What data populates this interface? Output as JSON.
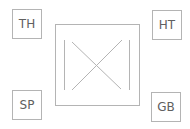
{
  "diagram": {
    "corner_labels": {
      "top_left": "TH",
      "top_right": "HT",
      "bottom_left": "SP",
      "bottom_right": "GB"
    },
    "center_symbol": "square-with-x-between-vertical-bars",
    "colors": {
      "stroke": "#b4b4b4",
      "text": "#606060",
      "background": "#ffffff"
    }
  }
}
